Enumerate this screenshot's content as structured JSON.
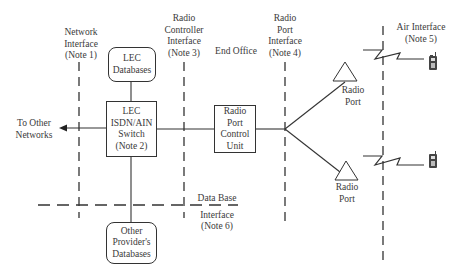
{
  "diagram": {
    "interfaces": {
      "network": "Network\nInterface\n(Note 1)",
      "network_lines": [
        "Network",
        "Interface",
        "(Note 1)"
      ],
      "radio_controller_lines": [
        "Radio",
        "Controller",
        "Interface",
        "(Note 3)"
      ],
      "end_office": "End Office",
      "radio_port_interface_lines": [
        "Radio",
        "Port",
        "Interface",
        "(Note 4)"
      ],
      "air_interface_lines": [
        "Air Interface",
        "(Note 5)"
      ],
      "data_base_lines": [
        "Data Base",
        "Interface",
        "(Note 6)"
      ]
    },
    "nodes": {
      "lec_databases_lines": [
        "LEC",
        "Databases"
      ],
      "lec_switch_lines": [
        "LEC",
        "ISDN/AIN",
        "Switch",
        "(Note 2)"
      ],
      "rpcu_lines": [
        "Radio",
        "Port",
        "Control",
        "Unit"
      ],
      "other_db_lines": [
        "Other",
        "Provider's",
        "Databases"
      ],
      "radio_port_top_lines": [
        "Radio",
        "Port"
      ],
      "radio_port_bottom_lines": [
        "Radio",
        "Port"
      ],
      "to_other_networks_lines": [
        "To Other",
        "Networks"
      ]
    },
    "icons": {
      "antenna": "triangle-antenna-icon",
      "phone": "mobile-phone-icon",
      "wireless": "lightning-zigzag-icon"
    },
    "colors": {
      "line": "#333333",
      "text": "#3a3a3a",
      "background": "#ffffff"
    }
  }
}
